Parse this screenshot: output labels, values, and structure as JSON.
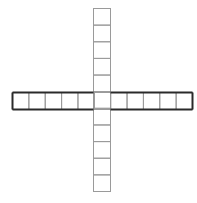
{
  "diagram": {
    "type": "cross-grid",
    "horizontal_row": {
      "cells": 11,
      "x": 12,
      "y": 92,
      "width": 180,
      "height": 17,
      "outline": "bold"
    },
    "vertical_column": {
      "cells": 11,
      "x": 93,
      "y": 8,
      "width": 17,
      "height": 183,
      "outline": "thin"
    },
    "colors": {
      "bold_stroke": "#2a2a2a",
      "thin_stroke": "#9a9a9a",
      "background": "#ffffff"
    }
  }
}
